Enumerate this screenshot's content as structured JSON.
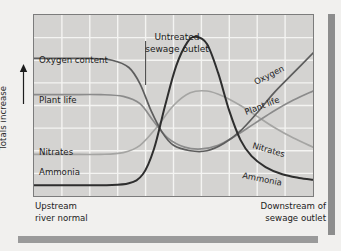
{
  "figure": {
    "title_line1": "Untreated",
    "title_line2": "sewage outlet",
    "y_axis_label": "Totals increase",
    "caption_left": "Upstream\nriver normal",
    "caption_right": "Downstream of\nsewage outlet"
  },
  "left_labels": [
    {
      "text": "Oxygen content",
      "x": 5,
      "y": 48
    },
    {
      "text": "Plant life",
      "x": 5,
      "y": 88
    },
    {
      "text": "Nitrates",
      "x": 5,
      "y": 140
    },
    {
      "text": "Ammonia",
      "x": 5,
      "y": 160
    }
  ],
  "right_labels": [
    {
      "text": "Oxygen",
      "x": 222,
      "y": 70,
      "angle": -27
    },
    {
      "text": "Plant life",
      "x": 212,
      "y": 100,
      "angle": -21
    },
    {
      "text": "Nitrates",
      "x": 218,
      "y": 133,
      "angle": 16
    },
    {
      "text": "Ammonia",
      "x": 208,
      "y": 163,
      "angle": 11
    }
  ],
  "colors": {
    "page_background": "#f1f0ee",
    "plot_background": "#d4d3d1",
    "grid_line": "#f4f4f2",
    "frame_border": "#7c7c7c",
    "curve_oxygen": "#5d5d5d",
    "curve_plant_life": "#8b8b8b",
    "curve_nitrates": "#a5a5a3",
    "curve_ammonia": "#2e2e2e",
    "deco_bar": "#8d8d8d",
    "text": "#1d1d1d"
  },
  "chart_data": {
    "type": "line",
    "title": "Untreated sewage outlet",
    "xlabel": "",
    "ylabel": "Totals increase",
    "grid": true,
    "legend": "inline-curve-labels",
    "x_range_labels": [
      "Upstream river normal",
      "Downstream of sewage outlet"
    ],
    "x_grid_divisions": 10,
    "y_grid_divisions": 8,
    "sewage_outlet_marker_x_fraction": 0.4,
    "series": [
      {
        "name": "Oxygen content",
        "color": "#5d5d5d",
        "description": "High plateau upstream, falls steeply at the sewage outlet to a minimum, then recovers steadily and rises highest downstream",
        "points": [
          [
            0.0,
            0.76
          ],
          [
            0.1,
            0.76
          ],
          [
            0.2,
            0.76
          ],
          [
            0.28,
            0.75
          ],
          [
            0.34,
            0.71
          ],
          [
            0.38,
            0.62
          ],
          [
            0.42,
            0.47
          ],
          [
            0.46,
            0.35
          ],
          [
            0.5,
            0.28
          ],
          [
            0.56,
            0.25
          ],
          [
            0.62,
            0.25
          ],
          [
            0.68,
            0.29
          ],
          [
            0.74,
            0.36
          ],
          [
            0.8,
            0.46
          ],
          [
            0.86,
            0.57
          ],
          [
            0.93,
            0.68
          ],
          [
            1.0,
            0.79
          ]
        ]
      },
      {
        "name": "Plant life",
        "color": "#8b8b8b",
        "description": "Moderate plateau upstream, drops at the outlet, stays low then recovers gradually downstream",
        "points": [
          [
            0.0,
            0.56
          ],
          [
            0.12,
            0.56
          ],
          [
            0.24,
            0.56
          ],
          [
            0.32,
            0.55
          ],
          [
            0.38,
            0.51
          ],
          [
            0.43,
            0.41
          ],
          [
            0.48,
            0.32
          ],
          [
            0.54,
            0.27
          ],
          [
            0.6,
            0.26
          ],
          [
            0.66,
            0.28
          ],
          [
            0.72,
            0.33
          ],
          [
            0.79,
            0.4
          ],
          [
            0.86,
            0.47
          ],
          [
            0.93,
            0.53
          ],
          [
            1.0,
            0.58
          ]
        ]
      },
      {
        "name": "Nitrates",
        "color": "#a5a5a3",
        "description": "Low upstream, rises to a broad hump downstream of the outlet then declines slowly",
        "points": [
          [
            0.0,
            0.23
          ],
          [
            0.12,
            0.23
          ],
          [
            0.24,
            0.23
          ],
          [
            0.32,
            0.24
          ],
          [
            0.38,
            0.28
          ],
          [
            0.44,
            0.38
          ],
          [
            0.5,
            0.5
          ],
          [
            0.56,
            0.57
          ],
          [
            0.62,
            0.58
          ],
          [
            0.68,
            0.55
          ],
          [
            0.74,
            0.5
          ],
          [
            0.8,
            0.44
          ],
          [
            0.86,
            0.38
          ],
          [
            0.93,
            0.32
          ],
          [
            1.0,
            0.27
          ]
        ]
      },
      {
        "name": "Ammonia",
        "color": "#2e2e2e",
        "description": "Near zero upstream, sharp tall peak just after the sewage outlet, then falls steeply and tails off downstream",
        "points": [
          [
            0.0,
            0.06
          ],
          [
            0.14,
            0.06
          ],
          [
            0.26,
            0.06
          ],
          [
            0.34,
            0.07
          ],
          [
            0.39,
            0.12
          ],
          [
            0.43,
            0.26
          ],
          [
            0.47,
            0.5
          ],
          [
            0.51,
            0.72
          ],
          [
            0.55,
            0.85
          ],
          [
            0.58,
            0.88
          ],
          [
            0.62,
            0.84
          ],
          [
            0.66,
            0.68
          ],
          [
            0.7,
            0.47
          ],
          [
            0.74,
            0.31
          ],
          [
            0.78,
            0.22
          ],
          [
            0.83,
            0.16
          ],
          [
            0.89,
            0.12
          ],
          [
            0.95,
            0.1
          ],
          [
            1.0,
            0.09
          ]
        ]
      }
    ]
  }
}
